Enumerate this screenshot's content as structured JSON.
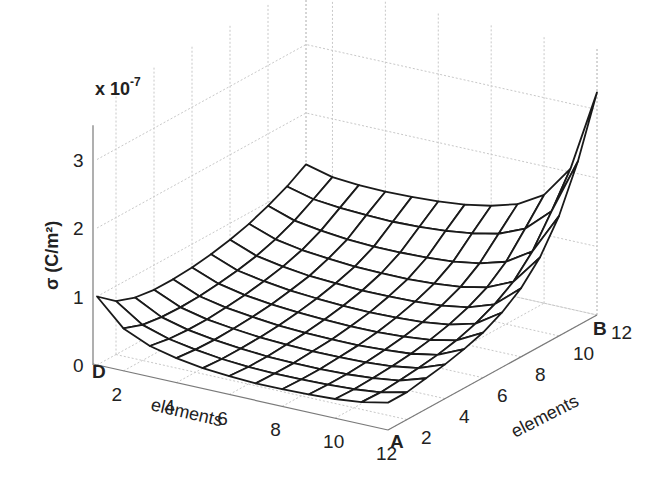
{
  "chart_data": {
    "type": "surface",
    "title": "",
    "xlabel": "elements",
    "ylabel": "elements",
    "zlabel": "σ (C/m²)",
    "z_multiplier": "x 10^-7",
    "z_multiplier_base": "x 10",
    "z_multiplier_exp": "-7",
    "x_ticks": [
      2,
      4,
      6,
      8,
      10,
      12
    ],
    "y_ticks": [
      2,
      4,
      6,
      8,
      10,
      12
    ],
    "z_ticks": [
      0,
      1,
      2,
      3
    ],
    "xlim": [
      1,
      12
    ],
    "ylim": [
      1,
      12
    ],
    "zlim": [
      0,
      3.5
    ],
    "corner_labels": {
      "front_left": "D",
      "front_right": "A",
      "back_right": "B"
    },
    "grid": true,
    "x": [
      1,
      2,
      3,
      4,
      5,
      6,
      7,
      8,
      9,
      10,
      11,
      12
    ],
    "y": [
      1,
      2,
      3,
      4,
      5,
      6,
      7,
      8,
      9,
      10,
      11,
      12
    ],
    "z": [
      [
        1.0,
        0.62,
        0.45,
        0.36,
        0.3,
        0.27,
        0.25,
        0.25,
        0.26,
        0.28,
        0.32,
        0.4
      ],
      [
        0.78,
        0.52,
        0.4,
        0.33,
        0.28,
        0.25,
        0.24,
        0.24,
        0.25,
        0.27,
        0.31,
        0.4
      ],
      [
        0.68,
        0.48,
        0.38,
        0.32,
        0.28,
        0.25,
        0.24,
        0.24,
        0.25,
        0.28,
        0.33,
        0.45
      ],
      [
        0.64,
        0.47,
        0.38,
        0.33,
        0.29,
        0.27,
        0.26,
        0.26,
        0.27,
        0.3,
        0.36,
        0.5
      ],
      [
        0.64,
        0.48,
        0.4,
        0.35,
        0.31,
        0.29,
        0.28,
        0.28,
        0.3,
        0.33,
        0.4,
        0.57
      ],
      [
        0.66,
        0.51,
        0.43,
        0.38,
        0.35,
        0.33,
        0.32,
        0.32,
        0.34,
        0.38,
        0.46,
        0.66
      ],
      [
        0.7,
        0.55,
        0.48,
        0.43,
        0.4,
        0.38,
        0.37,
        0.38,
        0.4,
        0.45,
        0.55,
        0.8
      ],
      [
        0.76,
        0.61,
        0.54,
        0.49,
        0.47,
        0.45,
        0.45,
        0.46,
        0.49,
        0.55,
        0.68,
        1.0
      ],
      [
        0.84,
        0.7,
        0.63,
        0.59,
        0.56,
        0.55,
        0.55,
        0.57,
        0.61,
        0.69,
        0.86,
        1.3
      ],
      [
        0.95,
        0.82,
        0.76,
        0.72,
        0.7,
        0.7,
        0.71,
        0.74,
        0.8,
        0.91,
        1.15,
        1.75
      ],
      [
        1.08,
        0.98,
        0.94,
        0.92,
        0.91,
        0.92,
        0.95,
        1.0,
        1.08,
        1.24,
        1.58,
        2.4
      ],
      [
        1.25,
        1.15,
        1.12,
        1.11,
        1.12,
        1.14,
        1.18,
        1.25,
        1.36,
        1.58,
        2.05,
        3.25
      ]
    ]
  },
  "colors": {
    "mesh_stroke": "#1a1a1a",
    "mesh_fill": "#ffffff",
    "grid": "#c8c8c8",
    "axis": "#7a7a7a",
    "text": "#222222"
  }
}
